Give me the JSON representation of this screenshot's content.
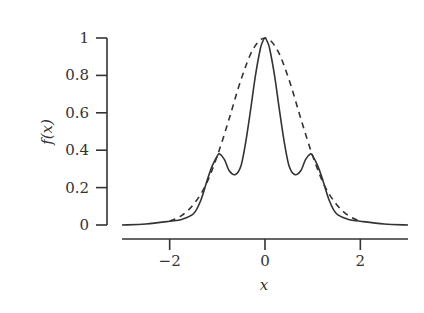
{
  "chart_data": {
    "type": "line",
    "title": "",
    "xlabel": "x",
    "ylabel": "f(x)",
    "xlim": [
      -3,
      3
    ],
    "ylim": [
      0,
      1
    ],
    "xticks": [
      -2,
      0,
      2
    ],
    "xtick_labels": [
      "−2",
      "0",
      "2"
    ],
    "yticks": [
      0,
      0.2,
      0.4,
      0.6,
      0.8,
      1
    ],
    "ytick_labels": [
      "0",
      "0.2",
      "0.4",
      "0.6",
      "0.8",
      "1"
    ],
    "grid": false,
    "legend": null,
    "series": [
      {
        "name": "solid",
        "style": "solid",
        "color": "#333333",
        "x": [
          -3.0,
          -2.5,
          -2.0,
          -1.75,
          -1.5,
          -1.35,
          -1.2,
          -1.1,
          -1.0,
          -0.95,
          -0.85,
          -0.75,
          -0.62,
          -0.5,
          -0.4,
          -0.3,
          -0.2,
          -0.1,
          -0.05,
          0.0,
          0.05,
          0.1,
          0.2,
          0.3,
          0.4,
          0.5,
          0.62,
          0.75,
          0.85,
          0.95,
          1.0,
          1.1,
          1.2,
          1.35,
          1.5,
          1.75,
          2.0,
          2.5,
          3.0
        ],
        "y": [
          0.0,
          0.005,
          0.02,
          0.03,
          0.06,
          0.13,
          0.25,
          0.32,
          0.37,
          0.38,
          0.35,
          0.29,
          0.27,
          0.32,
          0.45,
          0.62,
          0.8,
          0.94,
          0.98,
          1.0,
          0.98,
          0.94,
          0.8,
          0.62,
          0.45,
          0.32,
          0.27,
          0.29,
          0.35,
          0.38,
          0.37,
          0.32,
          0.25,
          0.13,
          0.06,
          0.03,
          0.02,
          0.005,
          0.0
        ]
      },
      {
        "name": "dashed",
        "style": "dashed",
        "color": "#333333",
        "x": [
          -2.0,
          -1.75,
          -1.5,
          -1.25,
          -1.0,
          -0.75,
          -0.5,
          -0.25,
          0.0,
          0.25,
          0.5,
          0.75,
          1.0,
          1.25,
          1.5,
          1.75,
          2.0
        ],
        "y": [
          0.02,
          0.05,
          0.11,
          0.21,
          0.37,
          0.57,
          0.78,
          0.94,
          1.0,
          0.94,
          0.78,
          0.57,
          0.37,
          0.21,
          0.11,
          0.05,
          0.02
        ]
      }
    ]
  },
  "layout": {
    "y_axis_px": {
      "x": 107,
      "y_top": 38,
      "y_bottom": 225,
      "tick_len": 11
    },
    "x_axis_px": {
      "y": 239,
      "x_left": 122,
      "x_right": 408,
      "tick_len": 11
    },
    "data_px": {
      "x_min_px": 122,
      "x_max_px": 408,
      "y_zero_px": 225,
      "y_one_px": 38
    }
  }
}
